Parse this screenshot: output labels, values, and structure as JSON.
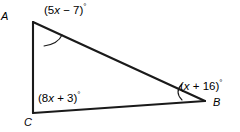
{
  "figure": {
    "background_color": "#ffffff",
    "stroke_color": "#1a1a1a",
    "vertices": [
      {
        "name": "A",
        "label": "A",
        "x": 33,
        "y": 22
      },
      {
        "name": "B",
        "label": "B",
        "x": 205,
        "y": 101
      },
      {
        "name": "C",
        "label": "C",
        "x": 33,
        "y": 113
      }
    ],
    "sides": [
      {
        "name": "side-AB",
        "from": "A",
        "to": "B"
      },
      {
        "name": "side-CB",
        "from": "C",
        "to": "B"
      },
      {
        "name": "side-AC",
        "from": "A",
        "to": "C"
      }
    ],
    "angles": [
      {
        "vertex": "A",
        "prefix": "(5",
        "variable": "x",
        "operator": " − 7)",
        "degree": "°",
        "full_text": "(5x − 7)°",
        "has_arc": true
      },
      {
        "vertex": "B",
        "prefix": "(",
        "variable": "x",
        "operator": " + 16)",
        "degree": "°",
        "full_text": "(x + 16)°",
        "has_arc": true
      },
      {
        "vertex": "C",
        "prefix": "(8",
        "variable": "x",
        "operator": " + 3)",
        "degree": "°",
        "full_text": "(8x + 3)°",
        "has_arc": false
      }
    ]
  }
}
